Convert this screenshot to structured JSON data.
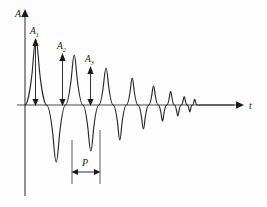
{
  "figure": {
    "background_color": "#fefefe",
    "curve_color": "#262626",
    "axis_color": "#4a4a4a",
    "label_color": "#1a1a1a"
  },
  "axes": {
    "vertical": {
      "label": "A",
      "label_meaning": "amplitude",
      "x": 25,
      "y_top": 12,
      "y_bottom": 196
    },
    "horizontal": {
      "label": "t",
      "label_meaning": "time",
      "y": 105,
      "x_left": 17,
      "x_right": 243
    }
  },
  "annotations": {
    "amplitudes": [
      {
        "name": "A",
        "subscript": "1",
        "peak_x": 35,
        "peak_y": 40,
        "baseline_y": 105,
        "value": 65
      },
      {
        "name": "A",
        "subscript": "2",
        "peak_x": 62,
        "peak_y": 55,
        "baseline_y": 105,
        "value": 50
      },
      {
        "name": "A",
        "subscript": "3",
        "peak_x": 90,
        "peak_y": 68,
        "baseline_y": 105,
        "value": 37
      }
    ],
    "period": {
      "label": "P",
      "label_meaning": "period",
      "start_x": 72,
      "end_x": 100,
      "measure_y": 172,
      "guide_top_y": 140,
      "guide_bottom_y": 182,
      "length_px": 28
    }
  },
  "chart_data": {
    "type": "line",
    "xlabel": "t",
    "ylabel": "A",
    "grid": false,
    "legend": null,
    "xlim": [
      0,
      230
    ],
    "ylim": [
      -80,
      80
    ],
    "model": {
      "function": "A(t) = A0 * exp(-t / tau) * sin(2*pi*t / P)",
      "A0": 68,
      "tau": 62,
      "P": 27.5,
      "t_start": 0,
      "t_end": 215
    },
    "peaks": {
      "t": [
        9.5,
        37,
        64.5,
        92,
        119.5,
        147,
        174.5
      ],
      "amplitude": [
        65,
        50,
        37,
        27,
        18,
        11,
        6
      ]
    },
    "troughs": {
      "t": [
        23,
        50.5,
        78,
        105.5,
        133,
        160.5
      ],
      "amplitude": [
        -57,
        -43,
        -31,
        -21,
        -14,
        -8
      ]
    },
    "annotation_points": [
      {
        "label": "A1",
        "t": 9.5,
        "value": 65
      },
      {
        "label": "A2",
        "t": 37,
        "value": 50
      },
      {
        "label": "A3",
        "t": 64.5,
        "value": 37
      },
      {
        "label": "P",
        "t_from": 50.5,
        "t_to": 78,
        "value": 27.5
      }
    ]
  }
}
